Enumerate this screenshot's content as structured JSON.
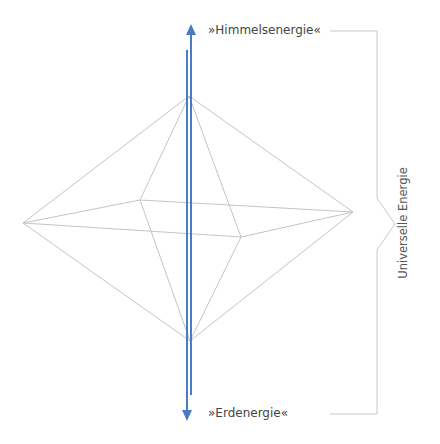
{
  "labels": {
    "top": "»Himmelsenergie«",
    "bottom": "»Erdenergie«",
    "side": "Universelle Energie"
  },
  "colors": {
    "arrow": "#4a7cc4",
    "edge": "#c4c4c4",
    "bracket": "#c8c8c8",
    "text": "#444444"
  },
  "octahedron": {
    "vertices": {
      "top": [
        189,
        96
      ],
      "bottom": [
        190,
        341
      ],
      "left": [
        23,
        223
      ],
      "right": [
        353,
        212
      ],
      "back": [
        140,
        200
      ],
      "front": [
        241,
        237
      ]
    }
  },
  "arrows": {
    "up": {
      "x": 191,
      "y_top": 25,
      "y_bottom": 395
    },
    "down": {
      "x": 187,
      "y_top": 50,
      "y_bottom": 420
    }
  }
}
